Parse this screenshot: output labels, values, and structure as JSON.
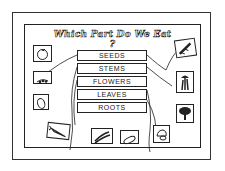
{
  "worksheet": {
    "title": "Which Part Do We Eat ?",
    "categories": [
      {
        "label": "SEEDS"
      },
      {
        "label": "STEMS"
      },
      {
        "label": "FLOWERS"
      },
      {
        "label": "LEAVES"
      },
      {
        "label": "ROOTS"
      }
    ],
    "pictures": [
      {
        "name": "tomato",
        "position": "left-top"
      },
      {
        "name": "peas",
        "position": "left-middle"
      },
      {
        "name": "lettuce",
        "position": "left-lower"
      },
      {
        "name": "corn",
        "position": "right-top"
      },
      {
        "name": "celery",
        "position": "right-middle"
      },
      {
        "name": "broccoli",
        "position": "right-lower"
      },
      {
        "name": "carrot",
        "position": "bottom-left"
      },
      {
        "name": "green-beans",
        "position": "bottom-center-left"
      },
      {
        "name": "pickle",
        "position": "bottom-center-right"
      },
      {
        "name": "cauliflower",
        "position": "bottom-right"
      }
    ],
    "colors": {
      "ink": "#222222",
      "paper": "#ffffff"
    }
  }
}
